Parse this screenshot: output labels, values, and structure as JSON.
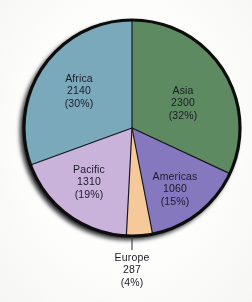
{
  "chart_data": {
    "type": "pie",
    "title": "",
    "xlabel": "",
    "ylabel": "",
    "total": 7097,
    "legend_position": "none",
    "labels_placement": "inside-slice, Europe callout outside",
    "grid": false,
    "categories": [
      "Africa",
      "Asia",
      "Americas",
      "Europe",
      "Pacific"
    ],
    "values": [
      2140,
      2300,
      1060,
      287,
      1310
    ],
    "percentages": [
      30,
      32,
      15,
      4,
      19
    ],
    "slices": [
      {
        "name": "Africa",
        "value": 2140,
        "value_text": "2140",
        "percent": 30,
        "percent_text": "(30%)",
        "color": "#7ba9bc",
        "start_angle_deg": 250,
        "end_angle_deg": 360,
        "label_inside": true
      },
      {
        "name": "Asia",
        "value": 2300,
        "value_text": "2300",
        "percent": 32,
        "percent_text": "(32%)",
        "color": "#5e8a62",
        "start_angle_deg": 0,
        "end_angle_deg": 115,
        "label_inside": true
      },
      {
        "name": "Americas",
        "value": 1060,
        "value_text": "1060",
        "percent": 15,
        "percent_text": "(15%)",
        "color": "#8578be",
        "start_angle_deg": 115,
        "end_angle_deg": 169,
        "label_inside": true
      },
      {
        "name": "Europe",
        "value": 287,
        "value_text": "287",
        "percent": 4,
        "percent_text": "(4%)",
        "color": "#f5c99a",
        "start_angle_deg": 169,
        "end_angle_deg": 183,
        "label_inside": false
      },
      {
        "name": "Pacific",
        "value": 1310,
        "value_text": "1310",
        "percent": 19,
        "percent_text": "(19%)",
        "color": "#c9b3db",
        "start_angle_deg": 183,
        "end_angle_deg": 250,
        "label_inside": true
      }
    ]
  },
  "figure": {
    "outline_color": "#0d0d0d",
    "shadow_color": "#121212",
    "background_color": "#fdfdfb",
    "label_text_color": "#1b1b28",
    "leader_line_color": "#3a3a46",
    "center_x": 132,
    "center_y": 128,
    "radius": 108
  },
  "labels": {
    "africa": {
      "name": "Africa",
      "value": "2140",
      "percent": "(30%)"
    },
    "asia": {
      "name": "Asia",
      "value": "2300",
      "percent": "(32%)"
    },
    "pacific": {
      "name": "Pacific",
      "value": "1310",
      "percent": "(19%)"
    },
    "americas": {
      "name": "Americas",
      "value": "1060",
      "percent": "(15%)"
    },
    "europe": {
      "name": "Europe",
      "value": "287",
      "percent": "(4%)"
    }
  }
}
